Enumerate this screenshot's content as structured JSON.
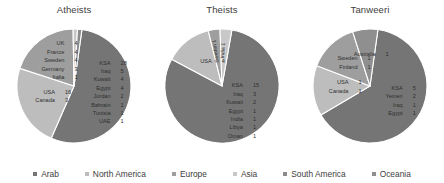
{
  "chart_data": [
    {
      "type": "pie",
      "title": "Atheists",
      "categories": [
        "Arab",
        "North America",
        "Europe",
        "Asia",
        "South America",
        "Oceania"
      ],
      "slices": [
        {
          "region": "Arab",
          "value": 44,
          "color": "#757575",
          "entries": [
            {
              "name": "KSA",
              "value": "28"
            },
            {
              "name": "Iraq",
              "value": "5"
            },
            {
              "name": "Kuwait",
              "value": "4"
            },
            {
              "name": "Egypt",
              "value": "4"
            },
            {
              "name": "Jordan",
              "value": "2"
            },
            {
              "name": "Bahrain",
              "value": "1"
            },
            {
              "name": "Tunisia",
              "value": "1"
            },
            {
              "name": "UAE",
              "value": "1"
            }
          ]
        },
        {
          "region": "North America",
          "value": 19,
          "color": "#bdbdbd",
          "entries": [
            {
              "name": "USA",
              "value": "16"
            },
            {
              "name": "Canada",
              "value": "3"
            }
          ]
        },
        {
          "region": "Europe",
          "value": 16,
          "color": "#9e9e9e",
          "entries": [
            {
              "name": "UK",
              "value": "4"
            },
            {
              "name": "France",
              "value": "4"
            },
            {
              "name": "Sweden",
              "value": "4"
            },
            {
              "name": "Germany",
              "value": "3"
            },
            {
              "name": "Italia",
              "value": "1"
            }
          ]
        },
        {
          "region": "Asia",
          "value": 1,
          "color": "#c8c8c8",
          "entries": []
        },
        {
          "region": "South America",
          "value": 1,
          "color": "#8a8a8a",
          "entries": []
        }
      ]
    },
    {
      "type": "pie",
      "title": "Theists",
      "categories": [
        "Arab",
        "North America",
        "Europe",
        "Asia",
        "South America",
        "Oceania"
      ],
      "slices": [
        {
          "region": "Arab",
          "value": 24,
          "color": "#757575",
          "entries": [
            {
              "name": "KSA",
              "value": "15"
            },
            {
              "name": "Iraq",
              "value": "3"
            },
            {
              "name": "Kuwait",
              "value": "2"
            },
            {
              "name": "Egypt",
              "value": "1"
            },
            {
              "name": "India",
              "value": "1"
            },
            {
              "name": "Libya",
              "value": "1"
            },
            {
              "name": "Oman",
              "value": "1"
            }
          ]
        },
        {
          "region": "North America",
          "value": 4,
          "color": "#bdbdbd",
          "entries": [
            {
              "name": "USA",
              "value": "4"
            }
          ]
        },
        {
          "region": "Europe",
          "value": 1,
          "color": "#9e9e9e",
          "entries": [
            {
              "name": "Sweden",
              "value": "1"
            }
          ]
        },
        {
          "region": "Asia",
          "value": 1,
          "color": "#c8c8c8",
          "entries": [
            {
              "name": "India",
              "value": "1"
            }
          ]
        }
      ]
    },
    {
      "type": "pie",
      "title": "Tanweeri",
      "categories": [
        "Arab",
        "North America",
        "Europe",
        "Asia",
        "South America",
        "Oceania"
      ],
      "slices": [
        {
          "region": "Arab",
          "value": 9,
          "color": "#757575",
          "entries": [
            {
              "name": "KSA",
              "value": "5"
            },
            {
              "name": "Yemen",
              "value": "2"
            },
            {
              "name": "Iraq",
              "value": "1"
            },
            {
              "name": "Egypt",
              "value": "1"
            }
          ]
        },
        {
          "region": "North America",
          "value": 2,
          "color": "#bdbdbd",
          "entries": [
            {
              "name": "USA",
              "value": "1"
            },
            {
              "name": "Canada",
              "value": "1"
            }
          ]
        },
        {
          "region": "Europe",
          "value": 2,
          "color": "#9e9e9e",
          "entries": [
            {
              "name": "Sweden",
              "value": "1"
            },
            {
              "name": "Finland",
              "value": "1"
            }
          ]
        },
        {
          "region": "Oceania",
          "value": 1,
          "color": "#8f8f8f",
          "entries": [
            {
              "name": "Australia",
              "value": "1"
            }
          ]
        }
      ]
    }
  ],
  "legend": {
    "position": "bottom",
    "items": [
      {
        "label": "Arab",
        "color": "#757575"
      },
      {
        "label": "North America",
        "color": "#bdbdbd"
      },
      {
        "label": "Europe",
        "color": "#9e9e9e"
      },
      {
        "label": "Asia",
        "color": "#c8c8c8"
      },
      {
        "label": "South America",
        "color": "#8a8a8a"
      },
      {
        "label": "Oceania",
        "color": "#8f8f8f"
      }
    ]
  }
}
